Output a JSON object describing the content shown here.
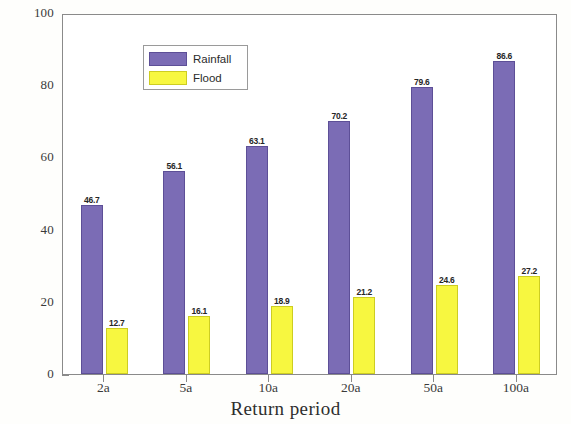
{
  "chart_data": {
    "type": "bar",
    "title": "",
    "subtitle": "",
    "xlabel": "Return period",
    "ylabel": "Depth (mm)",
    "categories": [
      "2a",
      "5a",
      "10a",
      "20a",
      "50a",
      "100a"
    ],
    "series": [
      {
        "name": "Rainfall",
        "color": "#7b6cb5",
        "values": [
          46.7,
          56.1,
          63.1,
          70.2,
          79.6,
          86.6
        ],
        "labels": [
          "46.7",
          "56.1",
          "63.1",
          "70.2",
          "79.6",
          "86.6"
        ]
      },
      {
        "name": "Flood",
        "color": "#f7f740",
        "values": [
          12.7,
          16.1,
          18.9,
          21.2,
          24.6,
          27.2
        ],
        "labels": [
          "12.7",
          "16.1",
          "18.9",
          "21.2",
          "24.6",
          "27.2"
        ]
      }
    ],
    "ylim": [
      0,
      100
    ],
    "yticks": [
      0,
      20,
      40,
      60,
      80,
      100
    ],
    "ytick_labels": [
      "0",
      "20",
      "40",
      "60",
      "80",
      "100"
    ],
    "grid": false,
    "legend_position": "top-left",
    "bar_labels_shown": true
  },
  "legend": {
    "entries": [
      {
        "label": "Rainfall"
      },
      {
        "label": "Flood"
      }
    ]
  }
}
